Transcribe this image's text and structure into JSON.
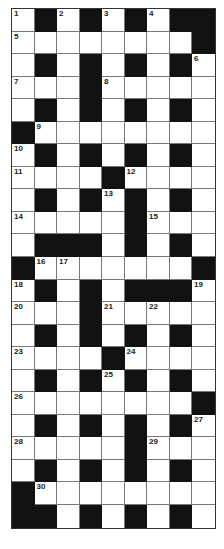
{
  "puzzle": {
    "columns": 9,
    "rows": 23,
    "colors": {
      "black_cell": "#111111",
      "white_cell": "#ffffff",
      "grid_line": "#777777"
    },
    "layout": [
      "W.W.W.W..",
      "WWWWWWWW.",
      "W.W.W.W.W",
      "WWW.WWWWW",
      "W.W.W.W.W",
      ".WWWWWWWW",
      "W.W.W.W.W",
      "WWWW.WWWW",
      "W.W.W.W.W",
      "WWWWW.WWW",
      "W...W.W.W",
      ".WWWWWWW.",
      "W.W.W...W",
      "WWW.WWWWW",
      "W.W.W.W.W",
      "WWWW.WWWW",
      "W.W.W.W.W",
      "WWWWWWWW.",
      "W.W.W.W.W",
      "WWWWW.WWW",
      "W.W.W.W.W",
      ".WWWWWWWW",
      "..W.W.W.W"
    ],
    "numbers": [
      {
        "r": 0,
        "c": 0,
        "n": "1"
      },
      {
        "r": 0,
        "c": 2,
        "n": "2"
      },
      {
        "r": 0,
        "c": 4,
        "n": "3"
      },
      {
        "r": 0,
        "c": 6,
        "n": "4"
      },
      {
        "r": 1,
        "c": 0,
        "n": "5"
      },
      {
        "r": 2,
        "c": 8,
        "n": "6"
      },
      {
        "r": 3,
        "c": 0,
        "n": "7"
      },
      {
        "r": 3,
        "c": 4,
        "n": "8"
      },
      {
        "r": 5,
        "c": 1,
        "n": "9"
      },
      {
        "r": 6,
        "c": 0,
        "n": "10"
      },
      {
        "r": 7,
        "c": 0,
        "n": "11"
      },
      {
        "r": 7,
        "c": 5,
        "n": "12"
      },
      {
        "r": 8,
        "c": 4,
        "n": "13"
      },
      {
        "r": 9,
        "c": 0,
        "n": "14"
      },
      {
        "r": 9,
        "c": 6,
        "n": "15"
      },
      {
        "r": 11,
        "c": 1,
        "n": "16"
      },
      {
        "r": 11,
        "c": 2,
        "n": "17"
      },
      {
        "r": 12,
        "c": 0,
        "n": "18"
      },
      {
        "r": 12,
        "c": 8,
        "n": "19"
      },
      {
        "r": 13,
        "c": 0,
        "n": "20"
      },
      {
        "r": 13,
        "c": 4,
        "n": "21"
      },
      {
        "r": 13,
        "c": 6,
        "n": "22"
      },
      {
        "r": 15,
        "c": 0,
        "n": "23"
      },
      {
        "r": 15,
        "c": 5,
        "n": "24"
      },
      {
        "r": 16,
        "c": 4,
        "n": "25"
      },
      {
        "r": 17,
        "c": 0,
        "n": "26"
      },
      {
        "r": 18,
        "c": 8,
        "n": "27"
      },
      {
        "r": 19,
        "c": 0,
        "n": "28"
      },
      {
        "r": 19,
        "c": 6,
        "n": "29"
      },
      {
        "r": 21,
        "c": 1,
        "n": "30"
      }
    ]
  }
}
